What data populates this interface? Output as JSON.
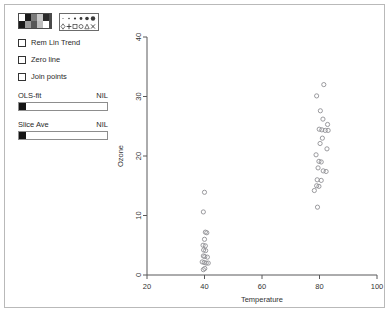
{
  "window": {
    "background": "#ffffff",
    "border_color": "#b9b9b9"
  },
  "controls": {
    "color_palette": {
      "name": "color-palette",
      "rows": [
        [
          "#ffffff",
          "#1a1a1a",
          "#7a7a7a",
          "#c8c8c8",
          "#2b2b2b"
        ],
        [
          "#1a1a1a",
          "#9a9a9a",
          "#575757",
          "#bdbdbd",
          "#ffffff"
        ]
      ]
    },
    "symbol_palette": {
      "name": "symbol-palette",
      "top_row": [
        "dot-1",
        "dot-2",
        "dot-3",
        "dot-4",
        "dot-5",
        "dot-6"
      ],
      "bottom_row": [
        "diamond",
        "plus",
        "square",
        "circle",
        "triangle",
        "cross"
      ]
    },
    "checkboxes": [
      {
        "label": "Rem Lin Trend",
        "checked": false,
        "name": "rem-lin-trend"
      },
      {
        "label": "Zero line",
        "checked": false,
        "name": "zero-line"
      },
      {
        "label": "Join points",
        "checked": false,
        "name": "join-points"
      }
    ],
    "sliders": [
      {
        "label": "OLS-fit",
        "value": "NIL",
        "position_pct": 0,
        "name": "ols-fit"
      },
      {
        "label": "Slice Ave",
        "value": "NIL",
        "position_pct": 0,
        "name": "slice-ave"
      }
    ]
  },
  "chart_data": {
    "type": "scatter",
    "title": "",
    "xlabel": "Temperature",
    "ylabel": "Ozone",
    "xlim": [
      20,
      100
    ],
    "ylim": [
      0,
      40
    ],
    "xticks": [
      20,
      40,
      60,
      80,
      100
    ],
    "yticks": [
      0,
      10,
      20,
      30,
      40
    ],
    "grid": false,
    "legend": "none",
    "marker": "open-circle",
    "marker_color": "#909094",
    "points": [
      [
        40.0,
        13.9
      ],
      [
        39.6,
        10.6
      ],
      [
        40.3,
        7.2
      ],
      [
        40.8,
        7.1
      ],
      [
        40.0,
        6.0
      ],
      [
        39.5,
        5.0
      ],
      [
        40.3,
        4.9
      ],
      [
        39.7,
        4.2
      ],
      [
        40.4,
        4.1
      ],
      [
        39.6,
        3.2
      ],
      [
        40.1,
        3.1
      ],
      [
        41.0,
        3.0
      ],
      [
        39.2,
        2.2
      ],
      [
        39.9,
        2.1
      ],
      [
        40.6,
        2.0
      ],
      [
        41.3,
        2.0
      ],
      [
        40.1,
        1.1
      ],
      [
        39.6,
        0.9
      ],
      [
        81.5,
        32.0
      ],
      [
        79.0,
        30.1
      ],
      [
        80.3,
        27.6
      ],
      [
        81.2,
        26.2
      ],
      [
        82.8,
        25.3
      ],
      [
        79.9,
        24.5
      ],
      [
        80.8,
        24.4
      ],
      [
        82.0,
        24.3
      ],
      [
        83.0,
        24.3
      ],
      [
        81.0,
        23.0
      ],
      [
        80.2,
        22.1
      ],
      [
        82.6,
        21.2
      ],
      [
        78.8,
        20.2
      ],
      [
        79.8,
        19.1
      ],
      [
        80.6,
        19.0
      ],
      [
        79.5,
        18.0
      ],
      [
        81.3,
        17.5
      ],
      [
        82.3,
        17.4
      ],
      [
        79.2,
        16.0
      ],
      [
        80.6,
        15.9
      ],
      [
        79.0,
        15.0
      ],
      [
        79.8,
        14.9
      ],
      [
        78.2,
        14.2
      ],
      [
        79.3,
        11.4
      ]
    ]
  }
}
